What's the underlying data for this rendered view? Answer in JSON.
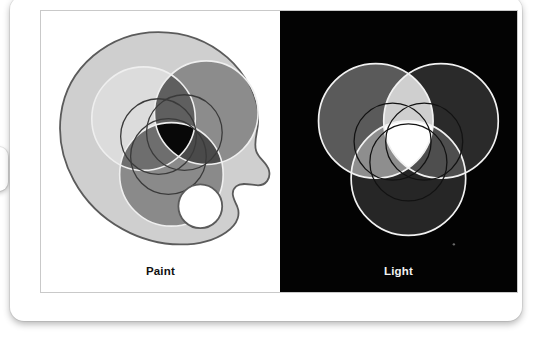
{
  "figure": {
    "panels": [
      {
        "id": "paint",
        "label": "Paint",
        "mode": "subtractive",
        "background": "#ffffff",
        "palette": {
          "fill": "#cfcfcf",
          "stroke": "#5a5a5a",
          "thumb_hole_fill": "#ffffff"
        },
        "circles": [
          {
            "name": "yellow-paint-circle",
            "position": "top-left",
            "gray": "#dcdcdc",
            "cx": 105,
            "cy": 110,
            "r": 54
          },
          {
            "name": "magenta-paint-circle",
            "position": "top-right",
            "gray": "#8c8c8c",
            "cx": 172,
            "cy": 104,
            "r": 54
          },
          {
            "name": "cyan-paint-circle",
            "position": "bottom",
            "gray": "#8a8a8a",
            "cx": 135,
            "cy": 168,
            "r": 54
          }
        ],
        "mix_center": {
          "name": "paint-mix-center",
          "gray": "#080808",
          "meaning": "all paints mixed = black"
        },
        "outline_circles": {
          "stroke_light": "#f2f2f2",
          "stroke_dark": "#333333",
          "count": 3
        }
      },
      {
        "id": "light",
        "label": "Light",
        "mode": "additive",
        "background": "#030303",
        "circles": [
          {
            "name": "green-light-circle",
            "position": "top-left",
            "gray": "#5a5a5a",
            "cx": 105,
            "cy": 110,
            "r": 54
          },
          {
            "name": "red-light-circle",
            "position": "top-right",
            "gray": "#2a2a2a",
            "cx": 172,
            "cy": 104,
            "r": 54
          },
          {
            "name": "blue-light-circle",
            "position": "bottom",
            "gray": "#262626",
            "cx": 135,
            "cy": 168,
            "r": 54
          }
        ],
        "mix_center": {
          "name": "light-mix-center",
          "gray": "#ffffff",
          "meaning": "all lights mixed = white"
        },
        "outline_circles": {
          "stroke_light": "#f4f4f4",
          "stroke_dark": "#1d1d1d",
          "count": 3
        }
      }
    ]
  }
}
